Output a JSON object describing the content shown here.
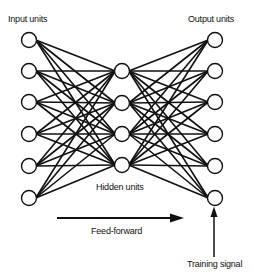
{
  "diagram": {
    "type": "feed-forward neural network",
    "labels": {
      "input": "Input units",
      "output": "Output units",
      "hidden": "Hidden units",
      "feedforward": "Feed-forward",
      "training": "Training signal"
    },
    "layers": {
      "input": {
        "x": 29,
        "ys": [
          40,
          71,
          102,
          134,
          166,
          198
        ]
      },
      "hidden": {
        "x": 122,
        "ys": [
          71,
          103,
          134,
          165
        ]
      },
      "output": {
        "x": 215,
        "ys": [
          40,
          71,
          102,
          134,
          166,
          198
        ]
      }
    },
    "node_radius": 7.5,
    "connectivity": "fully connected input→hidden and hidden→output",
    "colors": {
      "stroke": "#111111",
      "fill": "#ffffff",
      "background": "#ffffff"
    }
  }
}
